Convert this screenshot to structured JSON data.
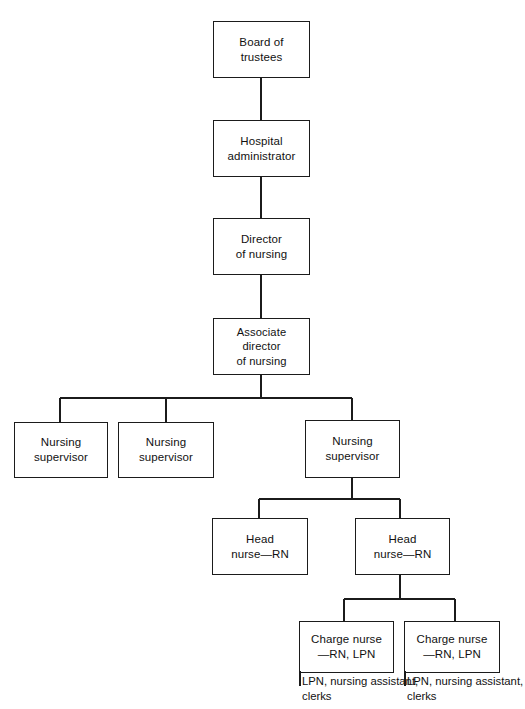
{
  "chart": {
    "type": "org-chart",
    "background_color": "#ffffff",
    "line_color": "#1b1b1b",
    "text_color": "#111111",
    "nodes": [
      {
        "id": "board",
        "label": "Board of\ntrustees",
        "x": 213,
        "y": 21,
        "w": 97,
        "h": 57
      },
      {
        "id": "admin",
        "label": "Hospital\nadministrator",
        "x": 213,
        "y": 120,
        "w": 97,
        "h": 57
      },
      {
        "id": "director",
        "label": "Director\nof nursing",
        "x": 213,
        "y": 218,
        "w": 97,
        "h": 57
      },
      {
        "id": "assoc",
        "label": "Associate director\nof nursing",
        "x": 213,
        "y": 318,
        "w": 97,
        "h": 57,
        "wide": true
      },
      {
        "id": "sup1",
        "label": "Nursing\nsupervisor",
        "x": 14,
        "y": 422,
        "w": 94,
        "h": 56
      },
      {
        "id": "sup2",
        "label": "Nursing\nsupervisor",
        "x": 118,
        "y": 422,
        "w": 96,
        "h": 56
      },
      {
        "id": "sup3",
        "label": "Nursing\nsupervisor",
        "x": 305,
        "y": 420,
        "w": 95,
        "h": 58
      },
      {
        "id": "head1",
        "label": "Head\nnurse—RN",
        "x": 212,
        "y": 518,
        "w": 96,
        "h": 57
      },
      {
        "id": "head2",
        "label": "Head\nnurse—RN",
        "x": 355,
        "y": 518,
        "w": 95,
        "h": 57
      },
      {
        "id": "charge1",
        "label": "Charge nurse\n—RN, LPN",
        "x": 299,
        "y": 621,
        "w": 95,
        "h": 52
      },
      {
        "id": "charge2",
        "label": "Charge nurse\n—RN, LPN",
        "x": 404,
        "y": 621,
        "w": 96,
        "h": 52
      }
    ],
    "leaf_texts": [
      {
        "id": "leaf1",
        "label": "LPN, nursing assistant,\nclerks",
        "x": 299,
        "y": 674
      },
      {
        "id": "leaf2",
        "label": "LPN, nursing assistant,\nclerks",
        "x": 404,
        "y": 674
      }
    ],
    "connectors": [
      {
        "from": "board",
        "to": "admin",
        "kind": "vertical",
        "x": 261,
        "y1": 78,
        "y2": 120
      },
      {
        "from": "admin",
        "to": "director",
        "kind": "vertical",
        "x": 261,
        "y1": 177,
        "y2": 218
      },
      {
        "from": "director",
        "to": "assoc",
        "kind": "vertical",
        "x": 261,
        "y1": 275,
        "y2": 318
      },
      {
        "from": "assoc",
        "to": "bus1",
        "kind": "vertical",
        "x": 261,
        "y1": 375,
        "y2": 398
      },
      {
        "from": "bus1",
        "to": "sup1",
        "kind": "bus",
        "x1": 60,
        "x2": 352,
        "y": 398,
        "drops": [
          60,
          166,
          352
        ],
        "drop_y2": 422
      },
      {
        "from": "sup3",
        "to": "bus2",
        "kind": "vertical",
        "x": 352,
        "y1": 478,
        "y2": 499
      },
      {
        "from": "bus2",
        "to": "heads",
        "kind": "bus",
        "x1": 259,
        "x2": 400,
        "y": 499,
        "drops": [
          259,
          400
        ],
        "drop_y2": 518
      },
      {
        "from": "head2",
        "to": "bus3",
        "kind": "vertical",
        "x": 400,
        "y1": 575,
        "y2": 599
      },
      {
        "from": "bus3",
        "to": "charges",
        "kind": "bus",
        "x1": 344,
        "x2": 455,
        "y": 599,
        "drops": [
          344,
          455
        ],
        "drop_y2": 621
      }
    ]
  }
}
